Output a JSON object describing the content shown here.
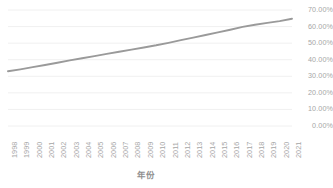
{
  "chart_data": {
    "type": "line",
    "title": "",
    "xlabel": "年份",
    "ylabel": "",
    "grid": true,
    "legend": "none",
    "line_color": "#9a9a9a",
    "axis_text_color": "#a6a6a6",
    "gridline_color": "#f0f0f0",
    "background_color": "#ffffff",
    "xlim": [
      1998,
      2021
    ],
    "ylim": [
      0,
      70
    ],
    "y_tick_labels": [
      "70.00%",
      "60.00%",
      "50.00%",
      "40.00%",
      "30.00%",
      "20.00%",
      "10.00%",
      "0.00%"
    ],
    "y_tick_values": [
      70,
      60,
      50,
      40,
      30,
      20,
      10,
      0
    ],
    "categories": [
      "1998",
      "1999",
      "2000",
      "2001",
      "2002",
      "2003",
      "2004",
      "2005",
      "2006",
      "2007",
      "2008",
      "2009",
      "2010",
      "2011",
      "2012",
      "2013",
      "2014",
      "2015",
      "2016",
      "2017",
      "2018",
      "2019",
      "2020",
      "2021"
    ],
    "values": [
      33.0,
      34.2,
      35.5,
      36.8,
      38.2,
      39.6,
      40.9,
      42.2,
      43.5,
      44.8,
      46.1,
      47.4,
      48.7,
      50.2,
      51.8,
      53.3,
      54.9,
      56.5,
      58.1,
      59.8,
      61.1,
      62.2,
      63.3,
      64.7
    ]
  }
}
